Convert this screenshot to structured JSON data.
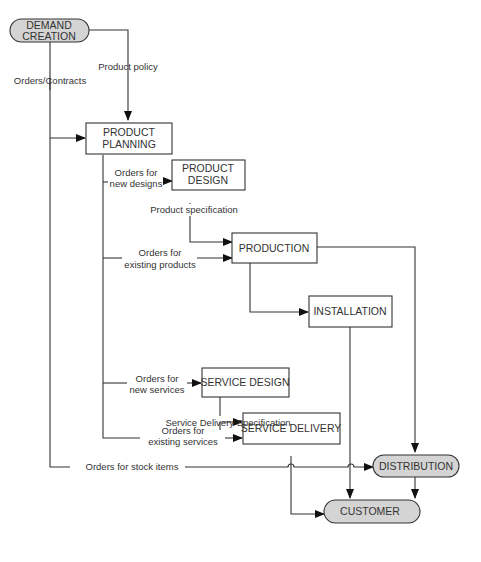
{
  "diagram": {
    "nodes": {
      "demand_creation": {
        "line1": "DEMAND",
        "line2": "CREATION",
        "type": "terminal"
      },
      "product_planning": {
        "line1": "PRODUCT",
        "line2": "PLANNING",
        "type": "process"
      },
      "product_design": {
        "line1": "PRODUCT",
        "line2": "DESIGN",
        "type": "process"
      },
      "production": {
        "label": "PRODUCTION",
        "type": "process"
      },
      "installation": {
        "label": "INSTALLATION",
        "type": "process"
      },
      "service_design": {
        "label": "SERVICE DESIGN",
        "type": "process"
      },
      "service_delivery": {
        "label": "SERVICE DELIVERY",
        "type": "process"
      },
      "distribution": {
        "label": "DISTRIBUTION",
        "type": "terminal"
      },
      "customer": {
        "label": "CUSTOMER",
        "type": "terminal"
      }
    },
    "edges": {
      "orders_contracts": "Orders/Contracts",
      "product_policy": "Product policy",
      "orders_new_designs_1": "Orders for",
      "orders_new_designs_2": "new designs",
      "product_specification": "Product specification",
      "orders_existing_products_1": "Orders for",
      "orders_existing_products_2": "existing products",
      "orders_new_services_1": "Orders for",
      "orders_new_services_2": "new services",
      "service_delivery_spec": "Service Delivery Specification",
      "orders_existing_services_1": "Orders for",
      "orders_existing_services_2": "existing services",
      "orders_stock_items": "Orders for stock items"
    },
    "colors": {
      "terminal_fill": "#d4d4d4",
      "line": "#333333",
      "box_fill": "#ffffff"
    }
  }
}
